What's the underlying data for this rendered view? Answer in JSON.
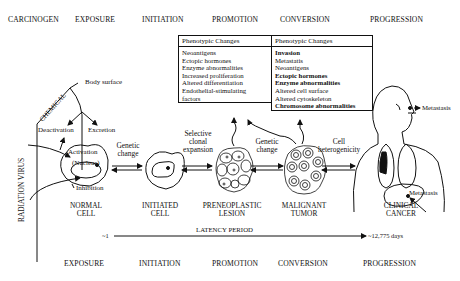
{
  "top_headers": [
    "CARCINOGEN",
    "EXPOSURE",
    "INITIATION",
    "PROMOTION",
    "CONVERSION",
    "PROGRESSION"
  ],
  "bottom_headers": [
    "EXPOSURE",
    "INITIATION",
    "PROMOTION",
    "CONVERSION",
    "PROGRESSION"
  ],
  "promotion_box": {
    "title": "Phenotypic Changes",
    "items": [
      "Neoantigens",
      "Ectopic hormones",
      "Enzyme abnormalities",
      "Increased proliferation",
      "Altered differentiation",
      "Endothelial-stimulating",
      "factors"
    ]
  },
  "conversion_box": {
    "title": "Phenotypic Changes",
    "items": [
      "Invasion",
      "Metastatis",
      "Neoantigens",
      "Ectopic hormones",
      "Enzyme abnormalities",
      "Altered cell surface",
      "Altered cytoskeleton",
      "Chromosome abnormalities"
    ]
  },
  "carcinogen_labels": {
    "chemical": "CHEMICAL",
    "radiation_virus": "RADIATION VIRUS",
    "body_surface": "Body surface",
    "deactivation": "Deactivation",
    "excretion": "Excretion",
    "activation": "Activation",
    "nucleus": "(Nucleus)",
    "inhibition": "Inhibition"
  },
  "transitions": {
    "genetic_change_1": [
      "Genetic",
      "change"
    ],
    "selective_clonal": [
      "Selective",
      "clonal",
      "expansion"
    ],
    "genetic_change_2": [
      "Genetic",
      "change"
    ],
    "cell_heterogenicity": [
      "Cell",
      "heterogenicity"
    ]
  },
  "stages": [
    {
      "line1": "NORMAL",
      "line2": "CELL"
    },
    {
      "line1": "INITIATED",
      "line2": "CELL"
    },
    {
      "line1": "PRENEOPLASTIC",
      "line2": "LESION"
    },
    {
      "line1": "MALIGNANT",
      "line2": "TUMOR"
    },
    {
      "line1": "CLINICAL",
      "line2": "CANCER"
    }
  ],
  "metastasis_labels": [
    "Metastasis",
    "Metastasis"
  ],
  "latency": {
    "label": "LATENCY PERIOD",
    "start": "~1",
    "end": "~12,775 days"
  }
}
